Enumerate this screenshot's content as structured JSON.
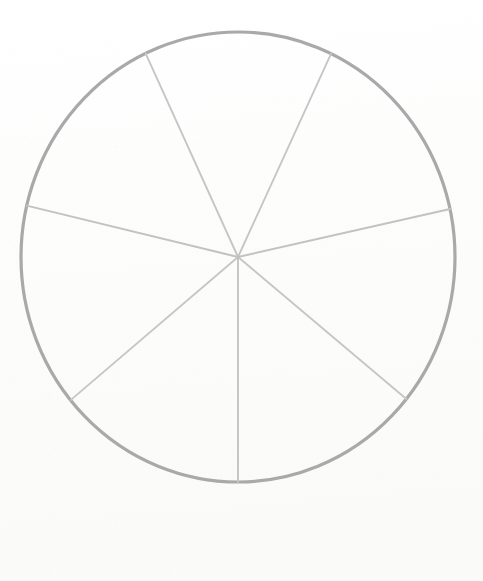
{
  "figure": {
    "background_color": "#fdfdfc",
    "canvas_width": 483,
    "canvas_height": 581
  },
  "chart_data": {
    "type": "pie",
    "title": "",
    "subtitle": "",
    "xlabel": "",
    "ylabel": "",
    "legend": [],
    "annotations": [],
    "grid": false,
    "labels_shown": false,
    "values_shown": false,
    "center_x": 238,
    "center_y": 257,
    "radius_x": 217,
    "radius_y": 225,
    "outline_color": "#a9a9a9",
    "outline_width": 3.2,
    "spoke_color": "#c9c9c9",
    "spoke_width": 1.8,
    "fill_color": "none",
    "slice_count": 7,
    "categories": [
      "1",
      "2",
      "3",
      "4",
      "5",
      "6",
      "7"
    ],
    "values": [
      50.6,
      52.3,
      51.4,
      50.9,
      51.5,
      52.7,
      50.6
    ],
    "boundary_angles_deg": [
      25.4,
      77.7,
      129.1,
      180.0,
      230.5,
      283.2,
      334.8
    ],
    "slice_angles_deg": [
      52.3,
      51.4,
      50.9,
      50.5,
      52.7,
      51.6,
      50.6
    ],
    "ylim": [
      0,
      360
    ]
  },
  "spokes": [
    {
      "name": "spoke-north-east",
      "angle_deg": 25.4,
      "end_x": 330,
      "end_y": 63
    },
    {
      "name": "spoke-east",
      "angle_deg": 77.7,
      "end_x": 444,
      "end_y": 212
    },
    {
      "name": "spoke-south-east",
      "angle_deg": 129.1,
      "end_x": 410,
      "end_y": 397
    },
    {
      "name": "spoke-south",
      "angle_deg": 180.0,
      "end_x": 237,
      "end_y": 482
    },
    {
      "name": "spoke-south-west",
      "angle_deg": 230.5,
      "end_x": 72,
      "end_y": 394
    },
    {
      "name": "spoke-west",
      "angle_deg": 283.2,
      "end_x": 25,
      "end_y": 207
    },
    {
      "name": "spoke-north-west",
      "angle_deg": 334.8,
      "end_x": 148,
      "end_y": 62
    }
  ]
}
